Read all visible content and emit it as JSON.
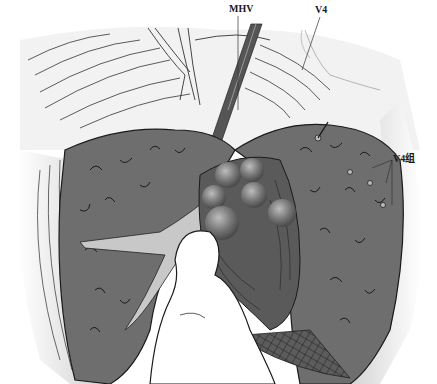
{
  "figure": {
    "type": "surgical-illustration",
    "labels": {
      "mhv": "MHV",
      "v4": "V4",
      "v4_group": "V4组"
    },
    "colors": {
      "background": "#ffffff",
      "liver_parenchyma": "#6e6e6e",
      "liver_cut_surface": "#5a5a5a",
      "peritoneum_light": "#d8d8d8",
      "finger": "#ffffff",
      "nodules": "#8a8a8a",
      "outline": "#1a1a1a"
    },
    "nodule_count": 6
  }
}
